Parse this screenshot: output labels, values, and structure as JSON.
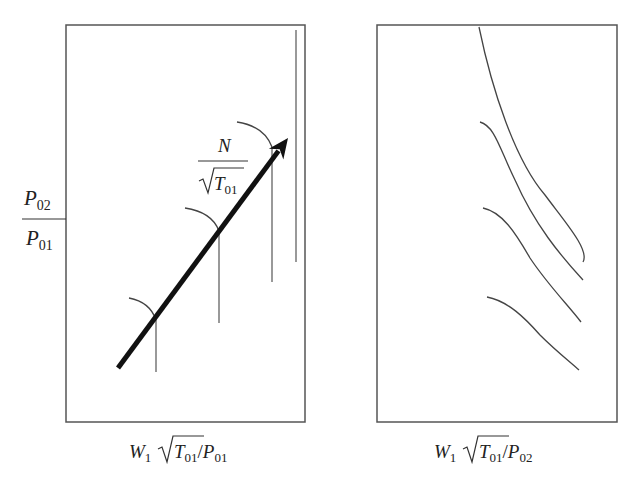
{
  "figure": {
    "colors": {
      "frame": "#555555",
      "curve": "#444444",
      "arrow": "#111111",
      "text": "#222222",
      "background": "#ffffff"
    },
    "left_panel": {
      "frame": {
        "x": 66,
        "y": 25,
        "w": 239,
        "h": 397
      },
      "y_axis_label": {
        "numerator": "P",
        "numerator_sub": "02",
        "denominator": "P",
        "denominator_sub": "01"
      },
      "x_axis_label": {
        "w": "W",
        "w_sub": "1",
        "t": "T",
        "t_sub": "01",
        "slash": "/",
        "p": "P",
        "p_sub": "01"
      },
      "speed_label": {
        "numerator": "N",
        "t": "T",
        "t_sub": "01"
      },
      "arrow": {
        "x1": 118,
        "y1": 368,
        "x2": 288,
        "y2": 138
      },
      "characteristics": [
        {
          "arc": "M129,298 Q150,302 156,320",
          "vline_x": 156,
          "vline_top": 320,
          "vline_bottom": 372
        },
        {
          "arc": "M185,208 Q212,212 219,231",
          "vline_x": 219,
          "vline_top": 231,
          "vline_bottom": 323
        },
        {
          "arc": "M237,122 Q264,126 272,147",
          "vline_x": 272,
          "vline_top": 147,
          "vline_bottom": 282
        }
      ],
      "choke_line": {
        "x": 296,
        "top": 30,
        "bottom": 262
      }
    },
    "right_panel": {
      "frame": {
        "x": 377,
        "y": 25,
        "w": 240,
        "h": 397
      },
      "x_axis_label": {
        "w": "W",
        "w_sub": "1",
        "t": "T",
        "t_sub": "01",
        "slash": "/",
        "p": "P",
        "p_sub": "02"
      },
      "curves": [
        "M479,27 C492,90 515,160 545,195 C565,222 590,250 583,262",
        "M480,122 C495,126 500,150 515,180 C535,225 560,255 583,280",
        "M483,208 C502,212 515,232 530,258 C548,285 568,305 581,322",
        "M487,297 C508,301 525,318 540,335 C555,350 570,362 579,370"
      ]
    }
  }
}
